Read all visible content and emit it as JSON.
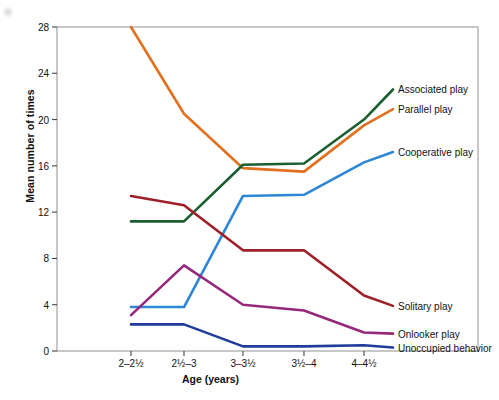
{
  "chart_data": {
    "type": "line",
    "title": "",
    "xlabel": "Age (years)",
    "ylabel": "Mean number of times",
    "categories": [
      "2–2½",
      "2½–3",
      "3–3½",
      "3½–4",
      "4–4½"
    ],
    "ylim": [
      0,
      28
    ],
    "yticks": [
      0,
      4,
      8,
      12,
      16,
      20,
      24,
      28
    ],
    "grid": false,
    "legend_position": "right-inline-labels",
    "series": [
      {
        "name": "Parallel play",
        "color": "#E2701E",
        "values": [
          28.0,
          20.5,
          15.8,
          15.5,
          19.5
        ],
        "label_y": 20.9
      },
      {
        "name": "Associated play",
        "color": "#1B5E32",
        "values": [
          11.2,
          11.2,
          16.1,
          16.2,
          20.0
        ],
        "label_y": 22.6
      },
      {
        "name": "Cooperative play",
        "color": "#2E86D6",
        "values": [
          3.8,
          3.8,
          13.4,
          13.5,
          16.3
        ],
        "label_y": 17.2
      },
      {
        "name": "Solitary play",
        "color": "#9E2026",
        "values": [
          13.4,
          12.6,
          8.7,
          8.7,
          4.8
        ],
        "label_y": 3.9
      },
      {
        "name": "Onlooker play",
        "color": "#96287C",
        "values": [
          3.1,
          7.4,
          4.0,
          3.5,
          1.6
        ],
        "label_y": 1.5
      },
      {
        "name": "Unoccupied behavior",
        "color": "#1F3C9B",
        "values": [
          2.3,
          2.3,
          0.4,
          0.4,
          0.5
        ],
        "label_y": 0.3
      }
    ]
  }
}
